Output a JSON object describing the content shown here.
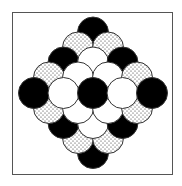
{
  "figure": {
    "frame": {
      "x": 12,
      "y": 12,
      "width": 161,
      "height": 163,
      "stroke": "#555555"
    },
    "circle_radius": 15.5,
    "fills": {
      "black": "#000000",
      "white": "#ffffff",
      "dotted": "dotted"
    },
    "rows": [
      {
        "y": 32.5,
        "circles": [
          {
            "x": 93,
            "fill": "black"
          }
        ]
      },
      {
        "y": 47.5,
        "circles": [
          {
            "x": 78,
            "fill": "dotted"
          },
          {
            "x": 108,
            "fill": "dotted"
          }
        ]
      },
      {
        "y": 62.5,
        "circles": [
          {
            "x": 63.5,
            "fill": "black"
          },
          {
            "x": 93,
            "fill": "white"
          },
          {
            "x": 122.5,
            "fill": "black"
          }
        ]
      },
      {
        "y": 77.5,
        "circles": [
          {
            "x": 49,
            "fill": "dotted"
          },
          {
            "x": 78,
            "fill": "white"
          },
          {
            "x": 108,
            "fill": "white"
          },
          {
            "x": 137,
            "fill": "dotted"
          }
        ]
      },
      {
        "y": 93,
        "circles": [
          {
            "x": 34,
            "fill": "black"
          },
          {
            "x": 63.5,
            "fill": "white"
          },
          {
            "x": 93,
            "fill": "black"
          },
          {
            "x": 122.5,
            "fill": "white"
          },
          {
            "x": 152,
            "fill": "black"
          }
        ]
      },
      {
        "y": 108,
        "circles": [
          {
            "x": 49,
            "fill": "dotted"
          },
          {
            "x": 78,
            "fill": "white"
          },
          {
            "x": 108,
            "fill": "white"
          },
          {
            "x": 137,
            "fill": "dotted"
          }
        ]
      },
      {
        "y": 123,
        "circles": [
          {
            "x": 63.5,
            "fill": "black"
          },
          {
            "x": 93,
            "fill": "white"
          },
          {
            "x": 122.5,
            "fill": "black"
          }
        ]
      },
      {
        "y": 138,
        "circles": [
          {
            "x": 78,
            "fill": "dotted"
          },
          {
            "x": 108,
            "fill": "dotted"
          }
        ]
      },
      {
        "y": 153,
        "circles": [
          {
            "x": 93,
            "fill": "black"
          }
        ]
      }
    ]
  }
}
